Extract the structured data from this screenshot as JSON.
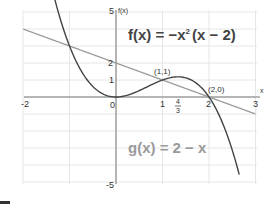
{
  "chart_data": {
    "type": "line",
    "title": "",
    "xlabel": "x",
    "ylabel": "f(x)",
    "xlim": [
      -2,
      3
    ],
    "ylim": [
      -5,
      5
    ],
    "grid": true,
    "x_ticks": [
      "-2",
      "0",
      "1",
      "4/3",
      "2",
      "3"
    ],
    "y_ticks": [
      "5",
      "2",
      "1",
      "-5"
    ],
    "series": [
      {
        "name": "f(x) = -x^2 (x-2)",
        "label": "f(x) = −x² (x − 2)",
        "color": "#444444",
        "expr": "-x*x*(x-2)",
        "x_range": [
          -1.45,
          2.65
        ],
        "points": [
          [
            -1.4,
            6.66
          ],
          [
            -1,
            3
          ],
          [
            0,
            0
          ],
          [
            1,
            1
          ],
          [
            1.333,
            1.185
          ],
          [
            2,
            0
          ],
          [
            2.5,
            -3.125
          ],
          [
            2.65,
            -4.56
          ]
        ]
      },
      {
        "name": "g(x) = 2 - x",
        "label": "g(x) = 2 − x",
        "color": "#9a9a9a",
        "expr": "2-x",
        "x_range": [
          -2,
          3
        ],
        "points": [
          [
            -2,
            4
          ],
          [
            0,
            2
          ],
          [
            1,
            1
          ],
          [
            2,
            0
          ],
          [
            3,
            -1
          ]
        ]
      }
    ],
    "annotations": [
      {
        "text": "(1,1)",
        "x": 1,
        "y": 1
      },
      {
        "text": "(2,0)",
        "x": 2,
        "y": 0
      }
    ],
    "tick_labels": {
      "x_neg2": "-2",
      "x_0": "0",
      "x_1": "1",
      "x_43_num": "4",
      "x_43_den": "3",
      "x_2": "2",
      "x_3": "3",
      "y_5": "5",
      "y_2": "2",
      "y_1": "1",
      "y_neg5": "-5"
    },
    "axis_labels": {
      "x": "x",
      "y": "f(x)"
    },
    "equations": {
      "f_lhs": "f(x)",
      "f_eq": "=",
      "f_rhs_a": "−x",
      "f_sup": "2",
      "f_rhs_b": "(x − 2)",
      "g_text": "g(x) = 2 − x"
    }
  }
}
